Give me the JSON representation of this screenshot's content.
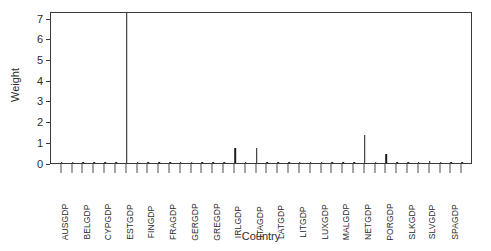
{
  "chart_data": {
    "type": "bar",
    "title": "",
    "xlabel": "Country",
    "ylabel": "Weight",
    "ylim": [
      0,
      7.35
    ],
    "yticks": [
      0,
      1,
      2,
      3,
      4,
      5,
      6,
      7
    ],
    "ytick_labels": [
      "0",
      "1",
      "2",
      "3",
      "4",
      "5",
      "6",
      "7"
    ],
    "grid": false,
    "legend": null,
    "bar_color": "#1c1c1c",
    "axis_color": "#3a3a3a",
    "categories": [
      "AUSGDP",
      "BELGDP",
      "CYPGDP",
      "ESTGDP",
      "FINGDP",
      "FRAGDP",
      "GERGDP",
      "GREGDP",
      "IRLGDP",
      "ITAGDP",
      "LATGDP",
      "LITGDP",
      "LUXGDP",
      "MALGDP",
      "NETGDP",
      "PORGDP",
      "SLKGDP",
      "SLVGDP",
      "SPAGDP"
    ],
    "series": [
      {
        "name": "Weight",
        "values": [
          0.05,
          0.03,
          0.06,
          7.32,
          0.07,
          0.04,
          0.03,
          0.05,
          0.75,
          0.74,
          0.04,
          0.06,
          0.05,
          0.04,
          1.35,
          0.42,
          0.05,
          0.09,
          0.04
        ]
      }
    ],
    "minor_values": [
      0.04,
      0.05,
      0.03,
      0.04,
      0.06,
      0.05,
      0.02,
      0.03,
      0.05,
      0.04,
      0.03,
      0.06,
      0.04,
      0.05,
      0.03,
      0.04,
      0.07,
      0.05,
      0.03
    ]
  },
  "axes": {
    "y_title": "Weight",
    "x_title": "Country"
  }
}
